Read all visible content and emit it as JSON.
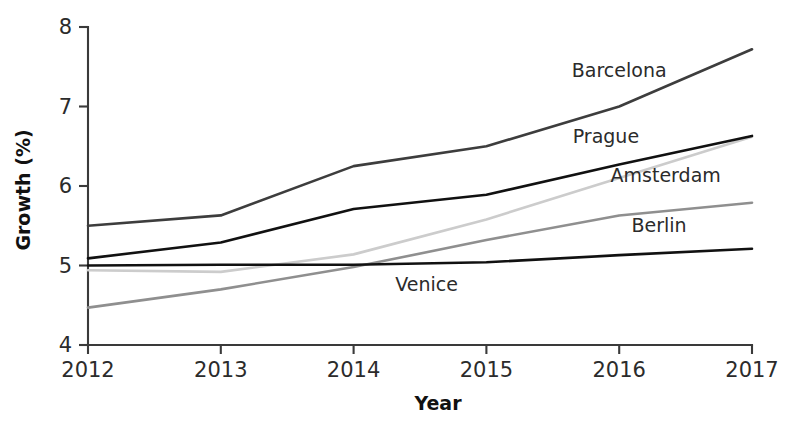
{
  "chart_data": {
    "type": "line",
    "title": "",
    "xlabel": "Year",
    "ylabel": "Growth (%)",
    "categories": [
      "2012",
      "2013",
      "2014",
      "2015",
      "2016",
      "2017"
    ],
    "x": [
      2012,
      2013,
      2014,
      2015,
      2016,
      2017
    ],
    "xlim": [
      2012,
      2017
    ],
    "ylim": [
      4,
      8
    ],
    "yticks": [
      "4",
      "5",
      "6",
      "7",
      "8"
    ],
    "ytick_values": [
      4,
      5,
      6,
      7,
      8
    ],
    "xticks": [
      "2012",
      "2013",
      "2014",
      "2015",
      "2016",
      "2017"
    ],
    "grid": false,
    "legend": "inline-labels-right",
    "series": [
      {
        "name": "Barcelona",
        "color": "#3d3d3d",
        "values": [
          5.5,
          5.63,
          6.25,
          6.5,
          7.0,
          7.72
        ],
        "label_x": 2016.0,
        "label_y": 7.45
      },
      {
        "name": "Prague",
        "color": "#111111",
        "values": [
          5.09,
          5.29,
          5.71,
          5.89,
          6.27,
          6.63
        ],
        "label_x": 2015.9,
        "label_y": 6.62
      },
      {
        "name": "Amsterdam",
        "color": "#cccccc",
        "values": [
          4.94,
          4.92,
          5.14,
          5.58,
          6.1,
          6.62
        ],
        "label_x": 2016.35,
        "label_y": 6.13
      },
      {
        "name": "Berlin",
        "color": "#8f8f8f",
        "values": [
          4.47,
          4.7,
          4.98,
          5.32,
          5.63,
          5.79
        ],
        "label_x": 2016.3,
        "label_y": 5.5
      },
      {
        "name": "Venice",
        "color": "#111111",
        "values": [
          5.0,
          5.01,
          5.01,
          5.04,
          5.13,
          5.21
        ],
        "label_x": 2014.55,
        "label_y": 4.76
      }
    ]
  },
  "axes": {
    "y_title": "Growth (%)",
    "x_title": "Year"
  }
}
